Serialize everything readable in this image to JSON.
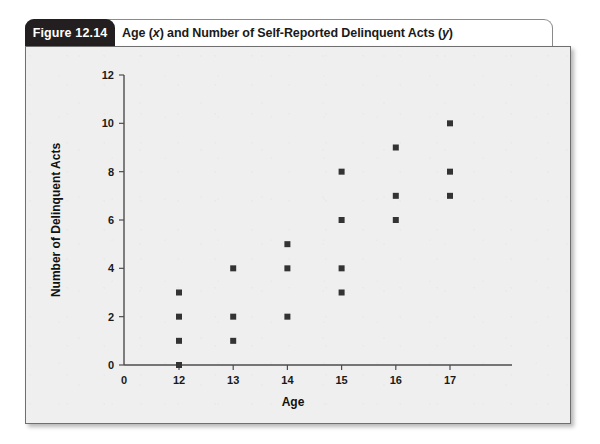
{
  "figure": {
    "tab_label": "Figure 12.14",
    "title_prefix": "Age (",
    "title_x_var": "x",
    "title_middle": ") and Number of Self-Reported Delinquent Acts (",
    "title_y_var": "y",
    "title_suffix": ")",
    "title_plain": "Age (x) and Number of Self-Reported Delinquent Acts (y)"
  },
  "colors": {
    "tab_background": "#231f20",
    "tab_text": "#ffffff",
    "card_background": "#efefef",
    "card_border": "#6f6f6f",
    "axis": "#4d4d4d",
    "marker": "#333333",
    "title_text": "#1a1a1a"
  },
  "chart_data": {
    "type": "scatter",
    "title": "Age (x) and Number of Self-Reported Delinquent Acts (y)",
    "xlabel": "Age",
    "ylabel": "Number of Delinquent Acts",
    "xlim": [
      0,
      18
    ],
    "ylim": [
      0,
      12
    ],
    "grid": false,
    "legend": null,
    "x_ticks": [
      0,
      12,
      13,
      14,
      15,
      16,
      17
    ],
    "x_tick_labels": [
      "0",
      "12",
      "13",
      "14",
      "15",
      "16",
      "17"
    ],
    "y_ticks": [
      0,
      2,
      4,
      6,
      8,
      10,
      12
    ],
    "y_tick_labels": [
      "0",
      "2",
      "4",
      "6",
      "8",
      "10",
      "12"
    ],
    "marker": "square",
    "series": [
      {
        "name": "Self-reported delinquent acts",
        "points": [
          {
            "x": 12,
            "y": 0
          },
          {
            "x": 12,
            "y": 1
          },
          {
            "x": 12,
            "y": 2
          },
          {
            "x": 12,
            "y": 3
          },
          {
            "x": 13,
            "y": 1
          },
          {
            "x": 13,
            "y": 2
          },
          {
            "x": 13,
            "y": 4
          },
          {
            "x": 14,
            "y": 2
          },
          {
            "x": 14,
            "y": 4
          },
          {
            "x": 14,
            "y": 5
          },
          {
            "x": 15,
            "y": 3
          },
          {
            "x": 15,
            "y": 4
          },
          {
            "x": 15,
            "y": 6
          },
          {
            "x": 15,
            "y": 8
          },
          {
            "x": 16,
            "y": 6
          },
          {
            "x": 16,
            "y": 7
          },
          {
            "x": 16,
            "y": 9
          },
          {
            "x": 17,
            "y": 7
          },
          {
            "x": 17,
            "y": 8
          },
          {
            "x": 17,
            "y": 10
          }
        ]
      }
    ]
  }
}
